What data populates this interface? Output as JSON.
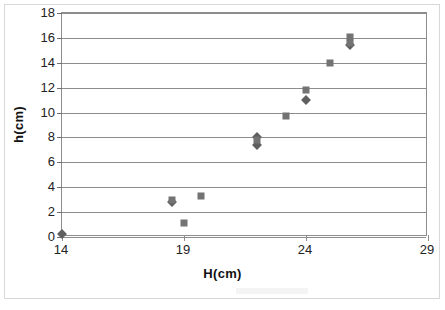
{
  "chart_data": {
    "type": "scatter",
    "title": "",
    "xlabel": "H(cm)",
    "ylabel": "h(cm)",
    "xlim": [
      14,
      29
    ],
    "ylim": [
      0,
      18
    ],
    "xticks": [
      14,
      19,
      24,
      29
    ],
    "yticks": [
      0,
      2,
      4,
      6,
      8,
      10,
      12,
      14,
      16,
      18
    ],
    "xtick_labels": [
      "14",
      "19",
      "24",
      "29"
    ],
    "ytick_labels": [
      "0",
      "2",
      "4",
      "6",
      "8",
      "10",
      "12",
      "14",
      "16",
      "18"
    ],
    "grid": "horizontal",
    "legend": "none",
    "marker_colors": {
      "diamond": "#5f5f5f",
      "square": "#737373"
    },
    "series": [
      {
        "name": "Series 1",
        "marker": "diamond",
        "points": [
          {
            "x": 14.0,
            "y": 0.25
          },
          {
            "x": 18.5,
            "y": 2.8
          },
          {
            "x": 22.0,
            "y": 7.4
          },
          {
            "x": 22.0,
            "y": 8.0
          },
          {
            "x": 24.0,
            "y": 11.0
          },
          {
            "x": 25.8,
            "y": 15.4
          }
        ]
      },
      {
        "name": "Series 2",
        "marker": "square",
        "points": [
          {
            "x": 18.5,
            "y": 3.0
          },
          {
            "x": 19.0,
            "y": 1.1
          },
          {
            "x": 19.7,
            "y": 3.3
          },
          {
            "x": 22.0,
            "y": 7.8
          },
          {
            "x": 23.2,
            "y": 9.7
          },
          {
            "x": 24.0,
            "y": 11.8
          },
          {
            "x": 25.0,
            "y": 14.0
          },
          {
            "x": 25.8,
            "y": 16.1
          },
          {
            "x": 25.8,
            "y": 15.6
          }
        ]
      }
    ]
  }
}
